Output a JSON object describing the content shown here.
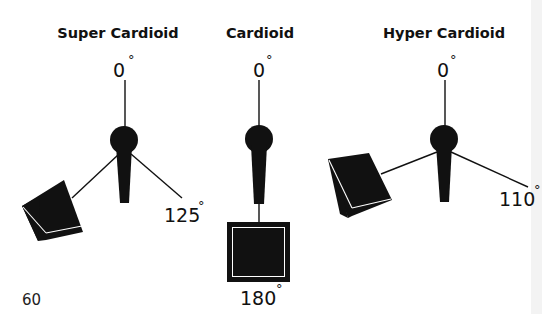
{
  "diagram": {
    "patterns": [
      {
        "id": "super-cardioid",
        "title": "Super Cardioid",
        "front_label": "0",
        "rear_label": "125",
        "degree_symbol": "°",
        "rejection_angle_deg": 125,
        "speaker_position": "rear-left"
      },
      {
        "id": "cardioid",
        "title": "Cardioid",
        "front_label": "0",
        "rear_label": "180",
        "degree_symbol": "°",
        "rejection_angle_deg": 180,
        "speaker_position": "rear"
      },
      {
        "id": "hyper-cardioid",
        "title": "Hyper Cardioid",
        "front_label": "0",
        "rear_label": "110",
        "degree_symbol": "°",
        "rejection_angle_deg": 110,
        "speaker_position": "rear-left"
      }
    ],
    "page_number": "60",
    "colors": {
      "ink": "#111111",
      "background": "#ffffff"
    }
  }
}
